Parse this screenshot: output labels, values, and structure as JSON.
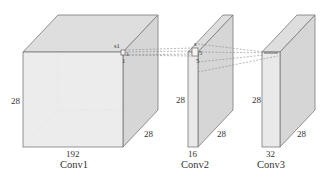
{
  "diagram": {
    "type": "cnn-layer-volumes",
    "layers": [
      {
        "name": "Conv1",
        "height_label": "28",
        "width_label": "192",
        "depth_label": "28",
        "kernel_labels": [
          "s1",
          "1",
          "1"
        ]
      },
      {
        "name": "Conv2",
        "height_label": "28",
        "width_label": "16",
        "depth_label": "28",
        "kernel_labels": [
          "s",
          "5",
          "5"
        ]
      },
      {
        "name": "Conv3",
        "height_label": "28",
        "width_label": "32",
        "depth_label": "28",
        "kernel_labels": []
      }
    ],
    "connections": [
      {
        "from": "Conv1",
        "to": "Conv2",
        "style": "dashed"
      },
      {
        "from": "Conv2",
        "to": "Conv3",
        "style": "dashed"
      }
    ],
    "colors": {
      "face": "#e9e9e9",
      "edge": "#7a7a7a",
      "dashed": "#8a8a8a",
      "text": "#333333"
    }
  }
}
